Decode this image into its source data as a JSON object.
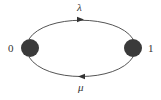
{
  "diagram": {
    "type": "state-transition",
    "nodes": [
      {
        "id": "0",
        "label": "0",
        "cx": 30,
        "cy": 48,
        "r": 9
      },
      {
        "id": "1",
        "label": "1",
        "cx": 133,
        "cy": 48,
        "r": 9
      }
    ],
    "edges": [
      {
        "from": "0",
        "to": "1",
        "label": "λ",
        "direction": "right",
        "position": "top"
      },
      {
        "from": "1",
        "to": "0",
        "label": "μ",
        "direction": "left",
        "position": "bottom"
      }
    ],
    "colors": {
      "node_fill": "#3a3a3a",
      "edge_stroke": "#555555",
      "text": "#333333",
      "background": "#ffffff"
    }
  }
}
